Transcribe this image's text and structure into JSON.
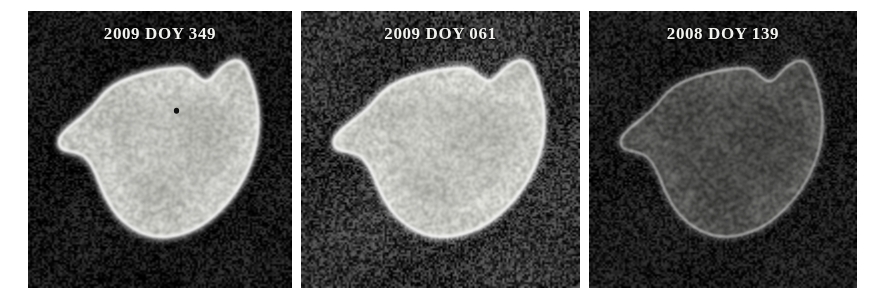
{
  "figure": {
    "kind": "sar-radar-image-series",
    "width": 884,
    "height": 305,
    "background_color": "#ffffff"
  },
  "panels": [
    {
      "id": "panel-1",
      "caption": "2009 DOY 349",
      "year": "2009",
      "doy": "349",
      "frame": {
        "x": 28,
        "y": 11,
        "width": 264,
        "height": 277
      },
      "caption_top": 13,
      "caption_font_size": 17,
      "sea_color": "#0c0c0c",
      "sea_color_2": "#1a1a1a",
      "island_fill": "#cfcfcb",
      "island_fill_2": "#b9b9b4",
      "island_edge": "#ffffff",
      "surface": "bright-snow-covered",
      "noise_opacity": 0.5
    },
    {
      "id": "panel-2",
      "caption": "2009 DOY 061",
      "year": "2009",
      "doy": "061",
      "frame": {
        "x": 301,
        "y": 11,
        "width": 279,
        "height": 277
      },
      "caption_top": 13,
      "caption_font_size": 17,
      "sea_color": "#242424",
      "sea_color_2": "#3a3a3a",
      "island_fill": "#d2d2cd",
      "island_fill_2": "#bdbdb8",
      "island_edge": "#ffffff",
      "surface": "bright-snow-covered",
      "noise_opacity": 0.72
    },
    {
      "id": "panel-3",
      "caption": "2008 DOY 139",
      "year": "2008",
      "doy": "139",
      "frame": {
        "x": 589,
        "y": 11,
        "width": 268,
        "height": 277
      },
      "caption_top": 13,
      "caption_font_size": 17,
      "sea_color": "#121212",
      "sea_color_2": "#1e1e1e",
      "island_fill": "#5a5a58",
      "island_fill_2": "#4b4b49",
      "island_edge": "#ffffff",
      "surface": "dark-bare-ground",
      "noise_opacity": 0.45
    }
  ],
  "island_outline": "M 86 96 C 96 84, 112 76, 126 72 C 146 66, 168 62, 186 62 C 196 62, 200 68, 206 72 C 212 77, 218 78, 224 72 C 232 64, 240 56, 250 54 C 258 53, 262 58, 266 66 C 272 78, 276 92, 278 106 C 280 124, 278 142, 272 158 C 264 180, 250 200, 232 216 C 214 232, 192 242, 170 244 C 148 246, 128 238, 112 224 C 100 213, 92 198, 86 184 C 80 170, 74 160, 66 156 C 58 152, 50 152, 44 150 C 38 148, 36 142, 40 136 C 46 128, 56 122, 64 116 C 72 110, 80 104, 86 96 Z",
  "island_inner_shading": [
    "M 110 104 C 130 94, 160 88, 190 90 C 210 92, 230 96, 248 104 C 258 109, 262 120, 260 132 C 256 150, 246 166, 232 180 C 214 198, 190 210, 166 210 C 142 210, 122 198, 110 180 C 100 164, 96 144, 100 124 C 102 114, 104 108, 110 104 Z"
  ],
  "island_dark_spot": {
    "cx": 180,
    "cy": 108,
    "r": 3.2
  },
  "colors": {
    "page_background": "#ffffff",
    "caption_text": "#f2f2ee",
    "panel_dark": "#0c0c0c"
  }
}
